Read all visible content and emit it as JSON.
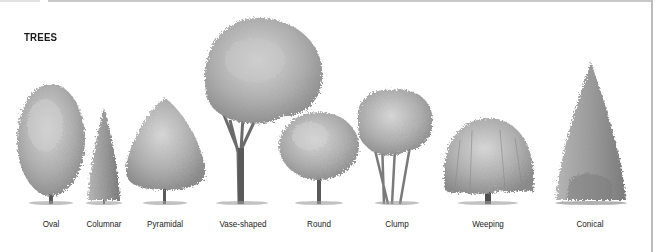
{
  "figure": {
    "title": "TREES",
    "trees": [
      {
        "id": "oval",
        "label": "Oval",
        "center_x": 51
      },
      {
        "id": "columnar",
        "label": "Columnar",
        "center_x": 104
      },
      {
        "id": "pyramidal",
        "label": "Pyramidal",
        "center_x": 165
      },
      {
        "id": "vase-shaped",
        "label": "Vase-shaped",
        "center_x": 243
      },
      {
        "id": "round",
        "label": "Round",
        "center_x": 319
      },
      {
        "id": "clump",
        "label": "Clump",
        "center_x": 397
      },
      {
        "id": "weeping",
        "label": "Weeping",
        "center_x": 488
      },
      {
        "id": "conical",
        "label": "Conical",
        "center_x": 590
      }
    ]
  },
  "colors": {
    "foliage_light": "#c9c9c9",
    "foliage_mid": "#a6a6a6",
    "foliage_dark": "#7c7c7c",
    "trunk": "#5a5a5a",
    "border": "#bdbdbd"
  }
}
